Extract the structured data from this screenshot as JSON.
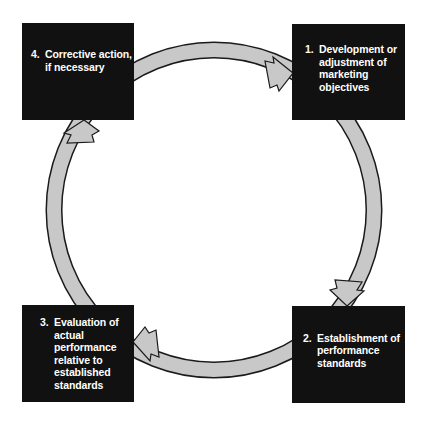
{
  "diagram": {
    "type": "cycle",
    "colors": {
      "box_fill": "#111111",
      "box_text": "#ffffff",
      "arrow_fill": "#c8c8c8",
      "arrow_outline": "#1a1a1a",
      "background": "#ffffff"
    },
    "steps": [
      {
        "number": "1.",
        "text": "Development or\nadjustment of\nmarketing\nobjectives"
      },
      {
        "number": "2.",
        "text": "Establishment of\nperformance\nstandards"
      },
      {
        "number": "3.",
        "text": "Evaluation of\nactual\nperformance\nrelative to\nestablished\nstandards"
      },
      {
        "number": "4.",
        "text": "Corrective action,\nif necessary"
      }
    ],
    "arrows": [
      {
        "from": "4",
        "to": "1",
        "direction": "clockwise"
      },
      {
        "from": "1",
        "to": "2",
        "direction": "clockwise"
      },
      {
        "from": "2",
        "to": "3",
        "direction": "clockwise"
      },
      {
        "from": "3",
        "to": "4",
        "direction": "clockwise"
      }
    ]
  }
}
